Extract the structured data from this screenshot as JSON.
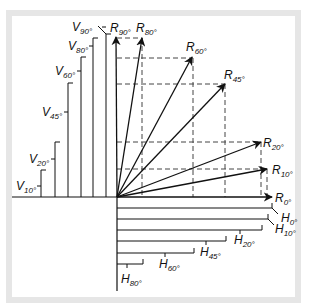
{
  "diagram": {
    "colors": {
      "line": "#111111",
      "frame": "#e6e6e6",
      "background": "#ffffff"
    },
    "origin": [
      117,
      197
    ],
    "resultants": [
      {
        "id": "R90",
        "letter": "R",
        "angle": "90°",
        "tip": [
          116,
          37
        ],
        "label_pos": [
          110,
          32
        ]
      },
      {
        "id": "R80",
        "letter": "R",
        "angle": "80°",
        "tip": [
          142,
          38
        ],
        "label_pos": [
          136,
          32
        ]
      },
      {
        "id": "R60",
        "letter": "R",
        "angle": "60°",
        "tip": [
          192,
          57
        ],
        "label_pos": [
          186,
          51
        ]
      },
      {
        "id": "R45",
        "letter": "R",
        "angle": "45°",
        "tip": [
          225,
          84
        ],
        "label_pos": [
          224,
          79
        ]
      },
      {
        "id": "R20",
        "letter": "R",
        "angle": "20°",
        "tip": [
          261,
          142
        ],
        "label_pos": [
          263,
          147
        ]
      },
      {
        "id": "R10",
        "letter": "R",
        "angle": "10°",
        "tip": [
          267,
          169
        ],
        "label_pos": [
          272,
          174
        ]
      },
      {
        "id": "R0",
        "letter": "R",
        "angle": "0°",
        "tip": [
          272,
          197
        ],
        "label_pos": [
          275,
          202
        ]
      }
    ],
    "vertical_components": [
      {
        "id": "V10",
        "letter": "V",
        "angle": "10°",
        "x": 41,
        "top": 170,
        "label_pos": [
          16,
          190
        ]
      },
      {
        "id": "V20",
        "letter": "V",
        "angle": "20°",
        "x": 55,
        "top": 142,
        "label_pos": [
          29,
          163
        ]
      },
      {
        "id": "V45",
        "letter": "V",
        "angle": "45°",
        "x": 68,
        "top": 83,
        "label_pos": [
          42,
          116
        ]
      },
      {
        "id": "V60",
        "letter": "V",
        "angle": "60°",
        "x": 81,
        "top": 57,
        "label_pos": [
          55,
          75
        ]
      },
      {
        "id": "V80",
        "letter": "V",
        "angle": "80°",
        "x": 93,
        "top": 38,
        "label_pos": [
          68,
          50
        ]
      },
      {
        "id": "V90",
        "letter": "V",
        "angle": "90°",
        "x": 106,
        "top": 34,
        "label_pos": [
          72,
          31
        ]
      }
    ],
    "horizontal_components": [
      {
        "id": "H0",
        "letter": "H",
        "angle": "0°",
        "y": 208,
        "right": 272,
        "label_pos": [
          281,
          222
        ]
      },
      {
        "id": "H10",
        "letter": "H",
        "angle": "10°",
        "y": 219,
        "right": 268,
        "label_pos": [
          275,
          233
        ]
      },
      {
        "id": "H20",
        "letter": "H",
        "angle": "20°",
        "y": 230,
        "right": 262,
        "label_pos": [
          234,
          244
        ]
      },
      {
        "id": "H45",
        "letter": "H",
        "angle": "45°",
        "y": 241,
        "right": 226,
        "label_pos": [
          200,
          256
        ]
      },
      {
        "id": "H60",
        "letter": "H",
        "angle": "60°",
        "y": 253,
        "right": 194,
        "label_pos": [
          159,
          268
        ]
      },
      {
        "id": "H80",
        "letter": "H",
        "angle": "80°",
        "y": 264,
        "right": 143,
        "label_pos": [
          121,
          283
        ]
      }
    ]
  }
}
